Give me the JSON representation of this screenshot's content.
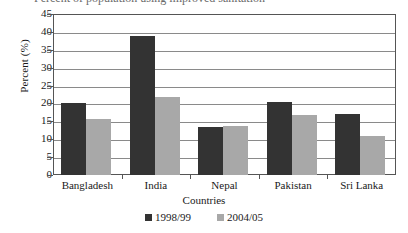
{
  "title_clipped": "Percent of population using improved sanitation",
  "axes": {
    "ylabel": "Percent (%)",
    "xlabel": "Countries",
    "yticks": [
      "45",
      "40",
      "35",
      "30",
      "25",
      "20",
      "15",
      "10",
      "5",
      "0"
    ]
  },
  "legend": {
    "items": [
      {
        "label": "1998/99",
        "color": "#333333",
        "swatch": "square-marker-icon"
      },
      {
        "label": "2004/05",
        "color": "#a8a8a8",
        "swatch": "square-marker-icon"
      }
    ]
  },
  "chart_data": {
    "type": "bar",
    "title": "Percent of population using improved sanitation",
    "xlabel": "Countries",
    "ylabel": "Percent (%)",
    "ylim": [
      0,
      45
    ],
    "ytick_step": 5,
    "grid": "horizontal",
    "legend_position": "bottom-center",
    "categories": [
      "Bangladesh",
      "India",
      "Nepal",
      "Pakistan",
      "Sri Lanka"
    ],
    "series": [
      {
        "name": "1998/99",
        "color": "#333333",
        "values": [
          20.0,
          38.8,
          13.5,
          20.5,
          17.0
        ]
      },
      {
        "name": "2004/05",
        "color": "#a8a8a8",
        "values": [
          15.7,
          21.8,
          13.7,
          16.8,
          10.8
        ]
      }
    ]
  }
}
